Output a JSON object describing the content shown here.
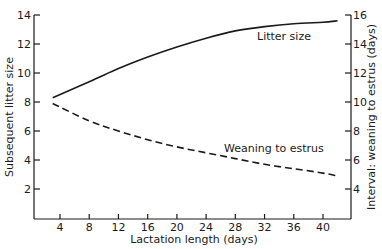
{
  "chart_data": {
    "type": "line",
    "title": "",
    "xlabel": "Lactation length (days)",
    "ylabel": "Subsequent litter size",
    "y2label": "Interval: weaning to estrus (days)",
    "xlim": [
      1,
      43
    ],
    "ylim": [
      0,
      14
    ],
    "y2lim": [
      2,
      16
    ],
    "x_ticks": [
      4,
      8,
      12,
      16,
      20,
      24,
      28,
      32,
      36,
      40
    ],
    "y_ticks": [
      2,
      4,
      6,
      8,
      10,
      12,
      14
    ],
    "y2_ticks": [
      4,
      6,
      8,
      10,
      12,
      14,
      16
    ],
    "grid": false,
    "legend": "inline labels",
    "series": [
      {
        "name": "Litter size",
        "axis": "left",
        "style": "solid",
        "x": [
          3,
          8,
          12,
          16,
          20,
          24,
          28,
          32,
          36,
          40,
          42
        ],
        "values": [
          8.3,
          9.4,
          10.3,
          11.1,
          11.8,
          12.4,
          12.9,
          13.2,
          13.4,
          13.5,
          13.6
        ]
      },
      {
        "name": "Weaning to estrus",
        "axis": "right",
        "style": "dashed",
        "x": [
          3,
          8,
          12,
          16,
          20,
          24,
          28,
          32,
          36,
          40,
          42
        ],
        "values": [
          9.9,
          8.7,
          8.0,
          7.4,
          6.9,
          6.5,
          6.1,
          5.7,
          5.4,
          5.1,
          4.9
        ]
      }
    ],
    "annotations": [
      {
        "text": "Litter size",
        "near_x": 33,
        "near_y": 12.5
      },
      {
        "text": "Weaning to estrus",
        "near_x": 30,
        "near_y": 6.6
      }
    ]
  },
  "labels": {
    "xlabel": "Lactation length (days)",
    "ylabel": "Subsequent litter size",
    "y2label": "Interval: weaning to estrus (days)",
    "series_litter": "Litter size",
    "series_weaning": "Weaning to estrus"
  }
}
